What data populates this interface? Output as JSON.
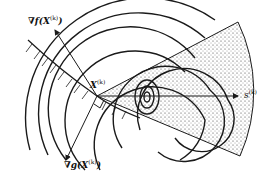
{
  "diagram": {
    "labels": {
      "grad_f": "∇f(X",
      "grad_f_sup": "(k)",
      "grad_f_close": ")",
      "point": "X",
      "point_sup": "(k)",
      "direction": "s",
      "direction_sup": "(k)",
      "grad_g": "∇g(X",
      "grad_g_sup": "(k)",
      "grad_g_close": ")"
    },
    "colors": {
      "ink": "#1a1a1a",
      "stipple": "#333333",
      "background": "#ffffff"
    }
  }
}
